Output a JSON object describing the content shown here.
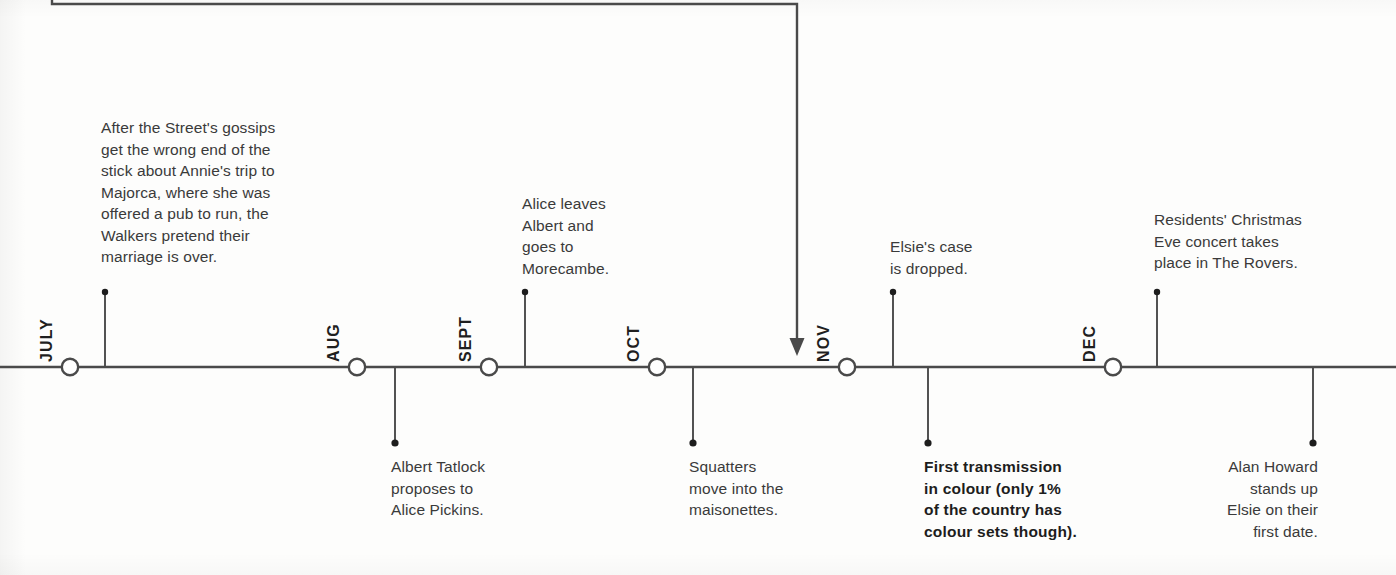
{
  "timeline": {
    "axis_color": "#4a4a4a",
    "text_color": "#3a3a3a",
    "marker_fill": "#ffffff",
    "months": [
      {
        "label": "JULY",
        "x": 70
      },
      {
        "label": "AUG",
        "x": 357
      },
      {
        "label": "SEPT",
        "x": 489
      },
      {
        "label": "OCT",
        "x": 657
      },
      {
        "label": "NOV",
        "x": 847
      },
      {
        "label": "DEC",
        "x": 1113
      }
    ],
    "events_above": [
      {
        "id": "walkers-marriage",
        "text": "After the Street's gossips\nget the wrong end of the\nstick about Annie's trip to\nMajorca, where she was\noffered a pub to run, the\nWalkers pretend their\nmarriage is over.",
        "stem_x": 105,
        "text_left": 101,
        "text_top": 117,
        "text_width": 240
      },
      {
        "id": "alice-leaves-albert",
        "text": "Alice leaves\nAlbert and\ngoes to\nMorecambe.",
        "stem_x": 525,
        "text_left": 522,
        "text_top": 193,
        "text_width": 150
      },
      {
        "id": "elsie-case-dropped",
        "text": "Elsie's case\nis dropped.",
        "stem_x": 893,
        "text_left": 890,
        "text_top": 236,
        "text_width": 160
      },
      {
        "id": "residents-christmas-concert",
        "text": "Residents' Christmas\nEve concert takes\nplace in The Rovers.",
        "stem_x": 1157,
        "text_left": 1154,
        "text_top": 209,
        "text_width": 215
      }
    ],
    "events_below": [
      {
        "id": "albert-proposes",
        "text": "Albert Tatlock\nproposes to\nAlice Pickins.",
        "stem_x": 395,
        "text_left": 391,
        "text_top": 456,
        "text_width": 180,
        "align": "left",
        "bold": false
      },
      {
        "id": "squatters-maisonettes",
        "text": "Squatters\nmove into the\nmaisonettes.",
        "stem_x": 693,
        "text_left": 689,
        "text_top": 456,
        "text_width": 180,
        "align": "left",
        "bold": false
      },
      {
        "id": "first-colour-transmission",
        "text": "First transmission\nin colour (only 1%\nof the country has\ncolour sets though).",
        "stem_x": 928,
        "text_left": 924,
        "text_top": 456,
        "text_width": 190,
        "align": "left",
        "bold": true
      },
      {
        "id": "alan-howard-stands-up-elsie",
        "text": "Alan Howard\nstands up\nElsie on their\nfirst date.",
        "stem_x": 1313,
        "text_left": 1158,
        "text_top": 456,
        "text_width": 160,
        "align": "right",
        "bold": false
      }
    ],
    "connector": {
      "id": "incoming-arrow-connector",
      "start_x": 52,
      "corner_x": 797,
      "top_y": 4,
      "arrow_y": 356
    }
  }
}
